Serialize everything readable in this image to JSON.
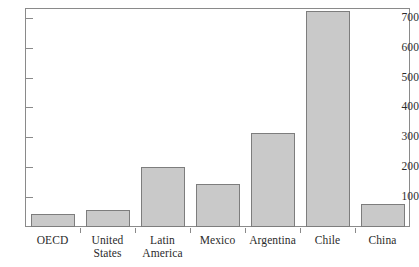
{
  "chart_data": {
    "type": "bar",
    "title": "",
    "subtitle": "",
    "xlabel": "",
    "ylabel": "",
    "categories": [
      "OECD",
      "United\nStates",
      "Latin\nAmerica",
      "Mexico",
      "Argentina",
      "Chile",
      "China"
    ],
    "values": [
      43,
      57,
      201,
      143,
      313,
      723,
      76
    ],
    "ylim": [
      0,
      733
    ],
    "yticks": [
      100,
      200,
      300,
      400,
      500,
      600,
      700
    ],
    "ytick_labels": [
      "100",
      "200",
      "300",
      "400",
      "500",
      "600",
      "700"
    ],
    "grid": false,
    "legend": null,
    "legend_position": "none",
    "bar_fill_color": "#c9c9c9",
    "bar_edge_color": "#7d7d7d",
    "axis_color": "#8a8a8a",
    "text_color": "#2b2b2b",
    "background_color": "#ffffff"
  },
  "figure": {
    "top_clipped_text": ""
  }
}
